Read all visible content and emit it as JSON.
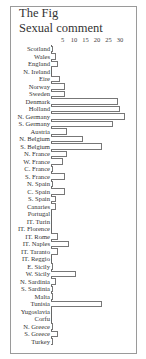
{
  "title": "The Fig",
  "subtitle": "Sexual comment",
  "chart_data": {
    "type": "bar",
    "orientation": "horizontal",
    "title": "The Fig",
    "subtitle": "Sexual comment",
    "xlabel": "",
    "ylabel": "",
    "xlim": [
      0,
      32
    ],
    "ticks": [
      "5",
      "10",
      "15",
      "20",
      "25",
      "30"
    ],
    "tick_values": [
      5,
      10,
      15,
      20,
      25,
      30
    ],
    "grid": false,
    "legend": null,
    "categories": [
      "Scotland",
      "Wales",
      "England",
      "N. Ireland",
      "Eire",
      "Norway",
      "Sweden",
      "Denmark",
      "Holland",
      "N. Germany",
      "S. Germany",
      "Austria",
      "N. Belgium",
      "S. Belgium",
      "N. France",
      "W. France",
      "C. France",
      "S. France",
      "N. Spain",
      "C. Spain",
      "S. Spain",
      "Canaries",
      "Portugal",
      "IT. Turin",
      "IT. Florence",
      "IT. Rome",
      "IT. Naples",
      "IT. Taranto",
      "IT. Reggio",
      "E. Sicily",
      "W. Sicily",
      "N. Sardinia",
      "S. Sardinia",
      "Malta",
      "Tunisia",
      "Yugoslavia",
      "Corfu",
      "N. Greece",
      "S. Greece",
      "Turkey"
    ],
    "values": [
      1,
      2,
      3,
      0,
      4,
      6,
      6,
      29,
      30,
      32,
      27,
      7,
      14,
      22,
      7,
      5,
      1,
      6,
      1,
      6,
      2,
      2,
      0,
      0,
      0,
      3,
      8,
      3,
      0,
      1,
      11,
      2,
      1,
      1,
      22,
      0,
      0,
      1,
      3,
      1
    ]
  }
}
